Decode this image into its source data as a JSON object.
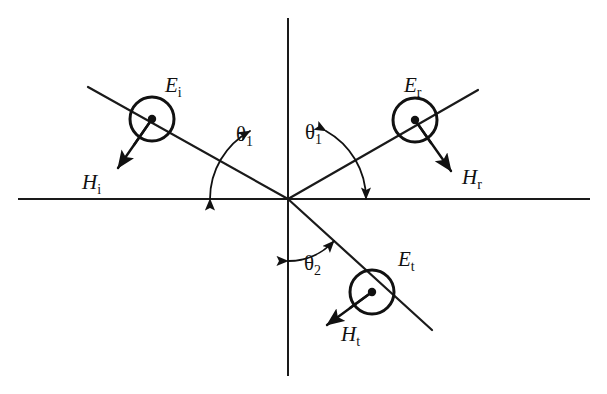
{
  "figure": {
    "type": "physics-diagram",
    "background_color": "#ffffff",
    "line_color": "#111111"
  },
  "geometry": {
    "origin": {
      "x": 288,
      "y": 199
    },
    "interface_line": {
      "x1": 18,
      "y1": 199,
      "x2": 590,
      "y2": 199
    },
    "normal_line": {
      "x1": 288,
      "y1": 18,
      "x2": 288,
      "y2": 376
    },
    "incident_ray": {
      "x1": 88,
      "y1": 87,
      "x2": 288,
      "y2": 199
    },
    "reflected_ray": {
      "x1": 288,
      "y1": 199,
      "x2": 478,
      "y2": 90
    },
    "transmitted_ray": {
      "x1": 288,
      "y1": 199,
      "x2": 432,
      "y2": 330
    }
  },
  "waves": [
    {
      "id": "incident",
      "e_label": "E",
      "e_subscript": "i",
      "e_label_pos": {
        "x": 165,
        "y": 92
      },
      "h_label": "H",
      "h_subscript": "i",
      "h_label_pos": {
        "x": 82,
        "y": 189
      },
      "circle": {
        "cx": 152,
        "cy": 119,
        "r": 22
      },
      "dot_r": 4.2,
      "h_arrow": {
        "x1": 152,
        "y1": 119,
        "x2": 118,
        "y2": 168
      },
      "radius_tick": {
        "x1": 152,
        "y1": 119,
        "x2": 134,
        "y2": 145
      }
    },
    {
      "id": "reflected",
      "e_label": "E",
      "e_subscript": "r",
      "e_label_pos": {
        "x": 404,
        "y": 92
      },
      "h_label": "H",
      "h_subscript": "r",
      "h_label_pos": {
        "x": 462,
        "y": 184
      },
      "circle": {
        "cx": 415,
        "cy": 120,
        "r": 22
      },
      "dot_r": 4.2,
      "h_arrow": {
        "x1": 415,
        "y1": 120,
        "x2": 451,
        "y2": 171
      },
      "radius_tick": {
        "x1": 415,
        "y1": 120,
        "x2": 431,
        "y2": 143
      }
    },
    {
      "id": "transmitted",
      "e_label": "E",
      "e_subscript": "t",
      "e_label_pos": {
        "x": 398,
        "y": 266
      },
      "h_label": "H",
      "h_subscript": "t",
      "h_label_pos": {
        "x": 341,
        "y": 341
      },
      "circle": {
        "cx": 372,
        "cy": 292,
        "r": 22
      },
      "dot_r": 4.2,
      "h_arrow": {
        "x1": 372,
        "y1": 292,
        "x2": 327,
        "y2": 325
      },
      "radius_tick": {
        "x1": 372,
        "y1": 292,
        "x2": 350,
        "y2": 308
      }
    }
  ],
  "angles": [
    {
      "id": "theta-1-incident",
      "symbol": "θ",
      "subscript": "1",
      "label_pos": {
        "x": 236,
        "y": 141
      },
      "arc": {
        "cx": 288,
        "cy": 199,
        "r": 78,
        "start_deg": 180,
        "end_deg": 119
      }
    },
    {
      "id": "theta-1-reflected",
      "symbol": "θ",
      "subscript": "1",
      "label_pos": {
        "x": 305,
        "y": 139
      },
      "arc": {
        "cx": 288,
        "cy": 199,
        "r": 78,
        "start_deg": 61,
        "end_deg": 0
      }
    },
    {
      "id": "theta-2-transmitted",
      "symbol": "θ",
      "subscript": "2",
      "label_pos": {
        "x": 304,
        "y": 270
      },
      "arc": {
        "cx": 288,
        "cy": 199,
        "r": 62,
        "start_deg": 0,
        "end_deg": -42
      }
    }
  ]
}
